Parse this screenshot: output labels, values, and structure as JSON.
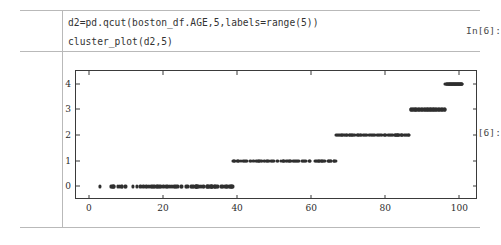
{
  "notebook": {
    "input_prompt": "In[6]:",
    "output_prompt": "Out[6]:",
    "code_lines": [
      "d2=pd.qcut(boston_df.AGE,5,labels=range(5))",
      "cluster_plot(d2,5)"
    ]
  },
  "chart_data": {
    "type": "scatter",
    "title": "",
    "xlabel": "",
    "ylabel": "",
    "xlim": [
      -3.5,
      104.5
    ],
    "ylim": [
      -0.45,
      4.5
    ],
    "xticks": [
      0,
      20,
      40,
      60,
      80,
      100
    ],
    "yticks": [
      0,
      1,
      2,
      3,
      4
    ],
    "grid": false,
    "legend": null,
    "marker_color": "#2f2f2f",
    "marker_size": 3,
    "series": [
      {
        "name": "cluster 0",
        "y": 0,
        "x": [
          2.9,
          6.0,
          6.2,
          6.5,
          6.6,
          6.8,
          7.8,
          8.4,
          8.9,
          9.0,
          9.8,
          10.0,
          11.9,
          13.0,
          13.9,
          14.7,
          15.3,
          15.7,
          16.3,
          16.8,
          17.0,
          17.2,
          17.5,
          17.8,
          18.4,
          18.5,
          18.8,
          19.1,
          19.5,
          20.1,
          20.8,
          21.0,
          21.4,
          21.9,
          22.3,
          22.9,
          23.3,
          23.4,
          23.9,
          24.8,
          25.0,
          26.3,
          26.6,
          27.6,
          27.7,
          28.1,
          28.4,
          28.8,
          28.9,
          29.0,
          29.1,
          29.2,
          29.3,
          29.6,
          30.2,
          30.7,
          31.1,
          31.9,
          32.0,
          32.2,
          32.3,
          32.8,
          33.0,
          33.1,
          33.2,
          33.3,
          33.8,
          34.0,
          34.1,
          34.2,
          34.5,
          34.9,
          35.7,
          35.9,
          36.1,
          36.6,
          36.9,
          37.2,
          37.3,
          37.8,
          38.1,
          38.3,
          38.4,
          38.5,
          38.7,
          38.9
        ]
      },
      {
        "name": "cluster 1",
        "y": 1,
        "x": [
          39.0,
          39.1,
          39.4,
          40.1,
          40.3,
          40.4,
          41.1,
          41.5,
          41.9,
          42.2,
          42.4,
          42.6,
          43.4,
          43.7,
          44.4,
          45.0,
          45.4,
          45.7,
          45.8,
          46.0,
          46.3,
          46.7,
          47.2,
          47.4,
          48.0,
          48.2,
          48.5,
          49.1,
          49.3,
          49.7,
          50.0,
          50.8,
          51.0,
          51.8,
          52.3,
          52.5,
          52.6,
          53.2,
          53.6,
          54.0,
          54.3,
          54.4,
          55.0,
          55.3,
          55.5,
          56.0,
          56.1,
          56.5,
          56.7,
          57.5,
          57.8,
          58.0,
          58.4,
          58.5,
          59.5,
          59.6,
          59.7,
          61.1,
          61.4,
          61.5,
          61.8,
          62.0,
          62.2,
          62.5,
          62.8,
          63.0,
          63.1,
          63.5,
          63.8,
          64.5,
          64.7,
          64.8,
          65.2,
          65.4,
          66.1,
          66.2,
          66.5,
          66.6
        ]
      },
      {
        "name": "cluster 2",
        "y": 2,
        "x": [
          66.7,
          67.0,
          67.2,
          67.6,
          67.8,
          68.1,
          68.2,
          68.4,
          68.7,
          69.1,
          69.5,
          69.6,
          69.7,
          70.2,
          70.4,
          70.6,
          70.9,
          71.0,
          71.3,
          71.6,
          71.9,
          72.5,
          72.7,
          72.9,
          73.3,
          73.4,
          73.9,
          74.3,
          74.4,
          74.8,
          75.0,
          75.7,
          76.0,
          76.5,
          76.7,
          77.0,
          77.3,
          77.7,
          78.1,
          78.3,
          78.7,
          79.2,
          79.7,
          79.8,
          79.9,
          80.3,
          80.8,
          81.0,
          81.3,
          81.6,
          81.8,
          82.0,
          82.5,
          82.6,
          82.9,
          83.0,
          83.2,
          83.3,
          83.4,
          83.5,
          83.7,
          84.1,
          84.4,
          84.5,
          84.6,
          85.1,
          85.4,
          85.7,
          85.9,
          86.1,
          86.3,
          86.5
        ]
      },
      {
        "name": "cluster 3",
        "y": 3,
        "x": [
          86.9,
          87.0,
          87.3,
          87.4,
          87.6,
          87.9,
          88.0,
          88.2,
          88.4,
          88.6,
          88.8,
          89.0,
          89.2,
          89.4,
          89.6,
          89.8,
          90.0,
          90.2,
          90.4,
          90.6,
          90.8,
          91.0,
          91.2,
          91.4,
          91.6,
          91.8,
          92.0,
          92.2,
          92.4,
          92.6,
          92.8,
          93.0,
          93.2,
          93.4,
          93.6,
          93.8,
          94.0,
          94.2,
          94.4,
          94.6,
          94.8,
          95.0,
          95.2,
          95.4,
          95.6,
          95.8,
          96.0,
          96.1
        ]
      },
      {
        "name": "cluster 4",
        "y": 4,
        "x": [
          96.2,
          96.4,
          96.6,
          96.7,
          96.8,
          97.0,
          97.1,
          97.2,
          97.3,
          97.4,
          97.5,
          97.6,
          97.7,
          97.8,
          97.9,
          98.0,
          98.1,
          98.2,
          98.3,
          98.4,
          98.5,
          98.6,
          98.7,
          98.8,
          98.9,
          99.0,
          99.1,
          99.2,
          99.3,
          99.4,
          99.5,
          99.6,
          99.7,
          99.8,
          99.9,
          100.0,
          100.1,
          100.2,
          100.3,
          100.4,
          100.5,
          100.6,
          100.7,
          100.8
        ]
      }
    ]
  }
}
